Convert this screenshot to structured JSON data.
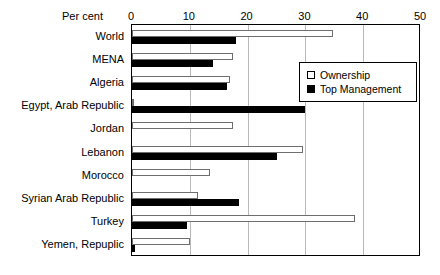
{
  "chart_data": {
    "type": "bar",
    "orientation": "horizontal",
    "title": "",
    "xlabel": "Per cent",
    "ylabel": "",
    "xlim": [
      0,
      50
    ],
    "xticks": [
      0,
      10,
      20,
      30,
      40,
      50
    ],
    "grid": true,
    "legend_position": "upper right",
    "categories": [
      "World",
      "MENA",
      "Algeria",
      "Egypt, Arab Republic",
      "Jordan",
      "Lebanon",
      "Morocco",
      "Syrian Arab Republic",
      "Turkey",
      "Yemen, Repuplic"
    ],
    "series": [
      {
        "name": "Ownership",
        "color": "#ffffff",
        "values": [
          34.8,
          17.5,
          17.0,
          0.4,
          17.5,
          29.5,
          13.5,
          11.5,
          38.5,
          10.0
        ]
      },
      {
        "name": "Top Management",
        "color": "#000000",
        "values": [
          18.0,
          14.0,
          16.5,
          30.0,
          0.0,
          25.0,
          0.0,
          18.5,
          9.5,
          0.6
        ]
      }
    ]
  },
  "axis": {
    "percent_label": "Per cent",
    "tick_labels": [
      "0",
      "10",
      "20",
      "30",
      "40",
      "50"
    ]
  },
  "legend": {
    "items": [
      {
        "label": "Ownership",
        "swatch": "hollow-square-icon"
      },
      {
        "label": "Top Management",
        "swatch": "filled-square-icon"
      }
    ]
  }
}
